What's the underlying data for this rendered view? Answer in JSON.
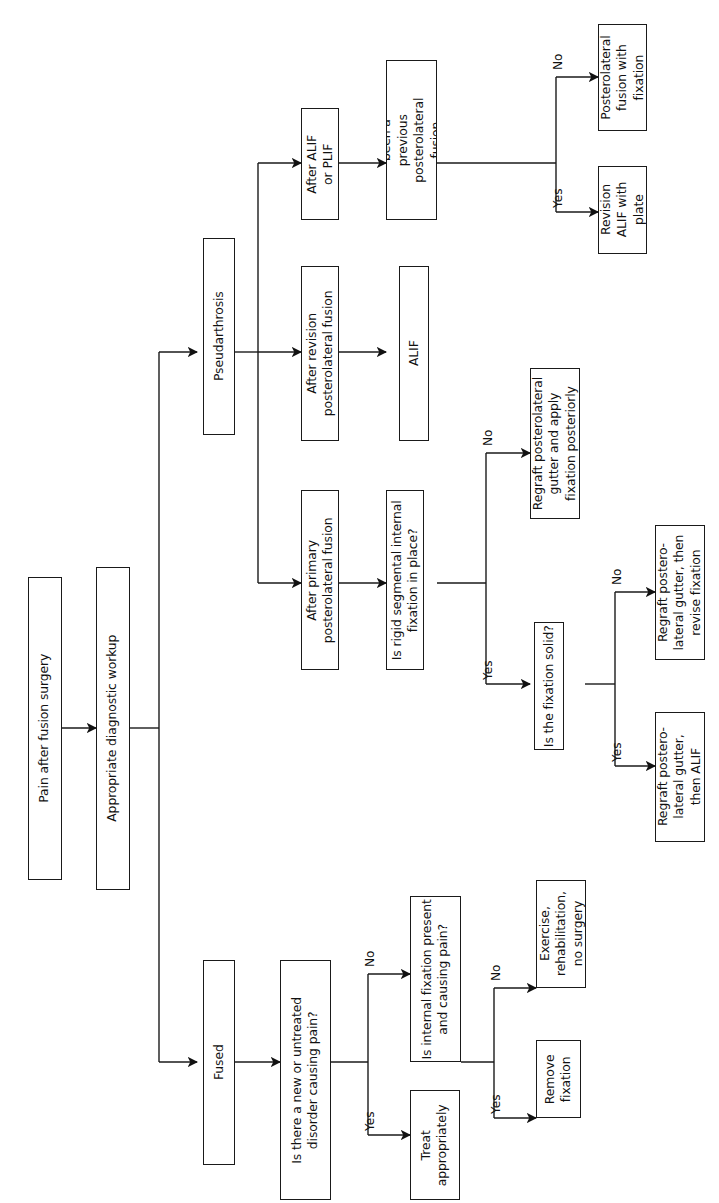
{
  "diagram": {
    "orientation": "rotated-90-ccw",
    "line_color": "#1a1a1a",
    "text_color": "#111111",
    "background": "#ffffff"
  },
  "nodes": {
    "start": "Pain after fusion surgery",
    "workup": "Appropriate diagnostic workup",
    "pseudarthrosis": "Pseudarthrosis",
    "fused": "Fused",
    "after_alif_plif": "After ALIF\nor PLIF",
    "prev_fusion_q": "Has there\nbeen a\nprevious\nposterolateral\nfusion\nattempt?",
    "plf_with_fixation": "Posterolateral\nfusion with\nfixation",
    "revision_alif_plate": "Revision\nALIF with\nplate",
    "after_revision_plf": "After revision\nposterolateral fusion",
    "alif": "ALIF",
    "after_primary_plf": "After primary\nposterolateral fusion",
    "rigid_fixation_q": "Is rigid segmental internal\nfixation in place?",
    "regraft_apply_fixation": "Regraft posterolateral\ngutter and apply\nfixation posteriorly",
    "fixation_solid_q": "Is the fixation solid?",
    "regraft_revise_fixation": "Regraft postero-\nlateral gutter, then\nrevise fixation",
    "regraft_then_alif": "Regraft postero-\nlateral gutter,\nthen ALIF",
    "new_disorder_q": "Is there a new or untreated\ndisorder causing pain?",
    "treat_appropriately": "Treat\nappropriately",
    "internal_fixation_q": "Is internal fixation present\nand causing pain?",
    "exercise_rehab": "Exercise,\nrehabilitation,\nno surgery",
    "remove_fixation": "Remove\nfixation"
  },
  "edge_labels": {
    "prev_fusion_no": "No",
    "prev_fusion_yes": "Yes",
    "rigid_fixation_no": "No",
    "rigid_fixation_yes": "Yes",
    "fixation_solid_no": "No",
    "fixation_solid_yes": "Yes",
    "new_disorder_no": "No",
    "new_disorder_yes": "Yes",
    "internal_fixation_no": "No",
    "internal_fixation_yes": "Yes"
  }
}
